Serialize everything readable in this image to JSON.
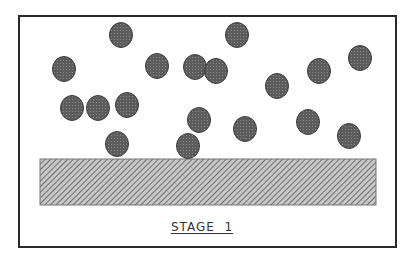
{
  "diagram": {
    "label": "STAGE  1",
    "colors": {
      "frame": "#2a2a2a",
      "particle_fill": "#5c5c5c",
      "particle_edge": "#3a3a3a",
      "particle_dot": "#8a8a8a",
      "hatch_line": "#555555",
      "hatch_bg": "#c8c8c8",
      "hatch_border": "#777777"
    },
    "frame": {
      "x": 19,
      "y": 16,
      "width": 377,
      "height": 231
    },
    "surface_block": {
      "x": 40,
      "y": 159,
      "width": 336,
      "height": 46,
      "pattern": "diagonal-hatch"
    },
    "particles": [
      {
        "cx": 121,
        "cy": 35
      },
      {
        "cx": 237,
        "cy": 35
      },
      {
        "cx": 64,
        "cy": 69
      },
      {
        "cx": 157,
        "cy": 66
      },
      {
        "cx": 195,
        "cy": 67
      },
      {
        "cx": 216,
        "cy": 71
      },
      {
        "cx": 319,
        "cy": 71
      },
      {
        "cx": 360,
        "cy": 58
      },
      {
        "cx": 277,
        "cy": 86
      },
      {
        "cx": 72,
        "cy": 108
      },
      {
        "cx": 98,
        "cy": 108
      },
      {
        "cx": 127,
        "cy": 105
      },
      {
        "cx": 199,
        "cy": 120
      },
      {
        "cx": 245,
        "cy": 129
      },
      {
        "cx": 308,
        "cy": 122
      },
      {
        "cx": 349,
        "cy": 136
      },
      {
        "cx": 117,
        "cy": 144
      },
      {
        "cx": 188,
        "cy": 146
      }
    ],
    "particle_rx": 11.5,
    "particle_ry": 12.5
  }
}
